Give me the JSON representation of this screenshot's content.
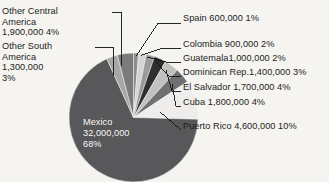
{
  "chart_data": {
    "type": "pie",
    "title": "",
    "xlabel": "",
    "ylabel": "",
    "units": "people",
    "start_angle_deg": 0,
    "direction": "clockwise",
    "categories": [
      "Spain",
      "Colombia",
      "Guatemala",
      "Dominican Rep.",
      "El Salvador",
      "Cuba",
      "Puerto Rico",
      "Mexico",
      "Other South America",
      "Other Central America"
    ],
    "values": [
      600000,
      900000,
      1000000,
      1400000,
      1700000,
      1800000,
      4600000,
      32000000,
      1300000,
      1900000
    ],
    "percents": [
      1,
      2,
      2,
      3,
      4,
      4,
      10,
      68,
      3,
      4
    ],
    "slice_colors": [
      "#8d8d8f",
      "#d6d4d2",
      "#9b9b9d",
      "#2f2f31",
      "#c3c1bf",
      "#707072",
      "#efedeb",
      "#58585a",
      "#a8a6a4",
      "#7b7b7d"
    ],
    "legend_position": "callout-labels",
    "grid": false
  },
  "labels": {
    "other_central_america": {
      "name": "Other Central America",
      "line1": "Other Central",
      "line2": "America",
      "line3": "1,900,000  4%",
      "value": "1,900,000",
      "percent": "4%"
    },
    "other_south_america": {
      "name": "Other South America",
      "line1": "Other South",
      "line2": "America",
      "line3": "1,300,000",
      "line4": "3%",
      "value": "1,300,000",
      "percent": "3%"
    },
    "spain": {
      "text": "Spain 600,000  1%"
    },
    "colombia": {
      "text": "Colombia 900,000  2%"
    },
    "guatemala": {
      "text": "Guatemala1,000,000  2%"
    },
    "dominican": {
      "text": "Dominican Rep.1,400,000  3%"
    },
    "el_salvador": {
      "text": "El Salvador 1,700,000  4%"
    },
    "cuba": {
      "text": "Cuba 1,800,000  4%"
    },
    "puerto_rico": {
      "text": "Puerto Rico 4,600,000 10%"
    },
    "mexico": {
      "line1": "Mexico",
      "line2": "32,000,000",
      "line3": "68%"
    }
  },
  "style": {
    "background": "#f6f4f1",
    "text_color": "#1b1b1b",
    "mexico_text_color": "#ffffff",
    "leader_line_color": "#111111"
  }
}
